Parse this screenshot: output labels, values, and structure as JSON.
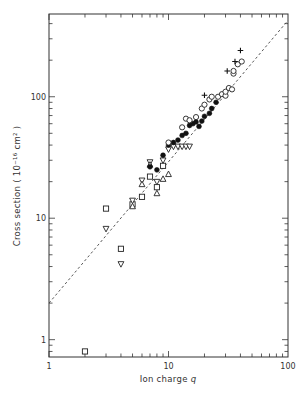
{
  "chart_data": {
    "type": "scatter",
    "title": "",
    "xlabel": "Ion charge q",
    "ylabel": "Cross section ( 10⁻¹⁶ cm² )",
    "xscale": "log",
    "yscale": "log",
    "xlim": [
      1,
      100
    ],
    "ylim": [
      0.72,
      480
    ],
    "x_ticks": [
      {
        "value": 1,
        "label": "1"
      },
      {
        "value": 10,
        "label": "10"
      },
      {
        "value": 100,
        "label": "100"
      }
    ],
    "y_ticks": [
      {
        "value": 1,
        "label": "1"
      },
      {
        "value": 10,
        "label": "10"
      },
      {
        "value": 100,
        "label": "100"
      }
    ],
    "grid": false,
    "legend": null,
    "fit_line": {
      "style": "dashed",
      "points": [
        [
          1,
          2.0
        ],
        [
          100,
          425
        ]
      ],
      "description": "power-law fit, sigma ≈ 2·q^1.16"
    },
    "series": [
      {
        "name": "open-square",
        "marker": "square",
        "points": [
          [
            2,
            0.8
          ],
          [
            3,
            12
          ],
          [
            4,
            5.6
          ],
          [
            5,
            13
          ],
          [
            6,
            15
          ],
          [
            7,
            22
          ],
          [
            8,
            18
          ],
          [
            9,
            27
          ]
        ]
      },
      {
        "name": "open-down-triangle",
        "marker": "triangle-down",
        "points": [
          [
            3,
            8.2
          ],
          [
            4,
            4.2
          ],
          [
            5,
            14
          ],
          [
            6,
            20.5
          ],
          [
            7,
            29
          ],
          [
            8,
            20
          ],
          [
            9,
            30
          ],
          [
            10,
            37
          ],
          [
            11,
            39
          ],
          [
            12,
            39
          ],
          [
            13,
            39
          ],
          [
            14,
            39
          ],
          [
            15,
            39
          ]
        ]
      },
      {
        "name": "open-up-triangle",
        "marker": "triangle-up",
        "points": [
          [
            5,
            12.5
          ],
          [
            6,
            19
          ],
          [
            7,
            27.5
          ],
          [
            8,
            16
          ],
          [
            9,
            21
          ],
          [
            10,
            23
          ]
        ]
      },
      {
        "name": "filled-circle",
        "marker": "circle-filled",
        "points": [
          [
            7,
            26.5
          ],
          [
            8,
            25
          ],
          [
            9,
            33
          ],
          [
            10,
            40
          ],
          [
            11,
            42
          ],
          [
            12,
            44
          ],
          [
            13,
            48
          ],
          [
            14,
            50
          ],
          [
            15,
            58
          ],
          [
            16,
            60
          ],
          [
            17,
            62
          ],
          [
            18,
            57
          ],
          [
            19,
            63
          ],
          [
            20,
            69
          ],
          [
            22,
            73
          ],
          [
            23,
            80
          ],
          [
            25,
            90
          ]
        ]
      },
      {
        "name": "open-circle",
        "marker": "circle-open",
        "points": [
          [
            10,
            42
          ],
          [
            13,
            56
          ],
          [
            14,
            66
          ],
          [
            15,
            64
          ],
          [
            17,
            68
          ],
          [
            19,
            80
          ],
          [
            20,
            86
          ],
          [
            22,
            95
          ],
          [
            23,
            100
          ],
          [
            26,
            100
          ],
          [
            28,
            105
          ],
          [
            30,
            102
          ],
          [
            30,
            110
          ],
          [
            32,
            118
          ],
          [
            34,
            115
          ],
          [
            35,
            155
          ],
          [
            35,
            163
          ],
          [
            38,
            185
          ],
          [
            41,
            195
          ]
        ]
      },
      {
        "name": "plus",
        "marker": "plus",
        "points": [
          [
            20,
            103
          ],
          [
            31,
            163
          ],
          [
            36,
            195
          ],
          [
            40,
            240
          ]
        ]
      }
    ]
  },
  "axes": {
    "x_title": "Ion charge ",
    "x_title_var": "q",
    "y_title": "Cross section ( 10⁻¹⁶ cm² )"
  }
}
